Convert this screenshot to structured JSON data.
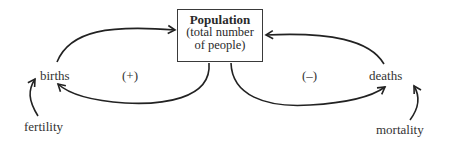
{
  "diagram": {
    "stock": {
      "title": "Population",
      "subtitle_line1": "(total number",
      "subtitle_line2": "of people)"
    },
    "flows": {
      "inflow": "births",
      "outflow": "deaths"
    },
    "drivers": {
      "inflow_driver": "fertility",
      "outflow_driver": "mortality"
    },
    "loops": {
      "reinforcing": "(+)",
      "balancing": "(–)"
    },
    "line_color": "#222222"
  }
}
